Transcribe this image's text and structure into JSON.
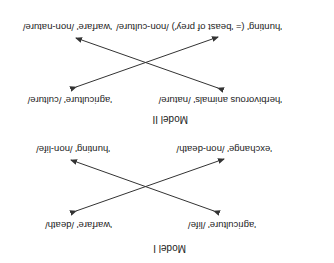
{
  "model_1": {
    "title": "Model I",
    "top_left": "'agriculture' /life/",
    "top_right": "'warfare' /death/",
    "bottom_left": "'exchange' /non-death/",
    "bottom_right": "'hunting' /non-life/"
  },
  "model_2": {
    "title": "Model II",
    "top_left": "'herbivorous animals' /nature/",
    "top_right": "'agriculture' /culture/",
    "bottom_left": "'hunting' (= 'beast of prey') /non-culture/",
    "bottom_right": "'warfare' /non-nature/"
  },
  "orientation": "rotated 180 degrees"
}
